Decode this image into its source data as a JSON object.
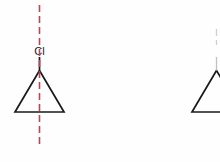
{
  "canvas": {
    "width": 220,
    "height": 162,
    "background": "#fefefe"
  },
  "colors": {
    "bond": "#1a1a1a",
    "mirror_plane": "#b04a5a",
    "label": "#1a1a1a",
    "background": "#fefefe"
  },
  "molecules": [
    {
      "id": "chlorocyclopropane-left",
      "name": "chlorocyclopropane",
      "substituent_label": "Cl",
      "label_position": {
        "x": 39.5,
        "y": 55
      },
      "ring": {
        "type": "cyclopropane",
        "vertices": [
          {
            "x": 39.5,
            "y": 70.5
          },
          {
            "x": 15,
            "y": 112
          },
          {
            "x": 64,
            "y": 112
          }
        ]
      },
      "substituent_bond": {
        "x1": 39.5,
        "y1": 70.5,
        "x2": 39.5,
        "y2": 57
      },
      "clipped": false
    },
    {
      "id": "chlorocyclopropane-right",
      "name": "chlorocyclopropane-mirror-image",
      "substituent_label": "",
      "ring": {
        "type": "cyclopropane",
        "vertices": [
          {
            "x": 216.5,
            "y": 70.5
          },
          {
            "x": 192,
            "y": 112
          },
          {
            "x": 241,
            "y": 112
          }
        ]
      },
      "substituent_bond": {
        "x1": 216.5,
        "y1": 70.5,
        "x2": 216.5,
        "y2": 57
      },
      "clipped": true
    }
  ],
  "mirror_plane": {
    "label": "mirror-plane",
    "orientation": "vertical",
    "x": 39.5,
    "y_top": 5,
    "y_bottom": 145,
    "dash": "7 4",
    "stroke_width": 1.6,
    "color": "#b04a5a"
  },
  "second_mirror_plane": {
    "label": "mirror-plane-right",
    "orientation": "vertical",
    "x": 216.5,
    "y_top": 29,
    "y_bottom": 45,
    "dash": "7 4",
    "stroke_width": 1.3,
    "color": "#cfcfcf"
  },
  "geometry": {
    "bond_stroke_width": 1.7
  }
}
